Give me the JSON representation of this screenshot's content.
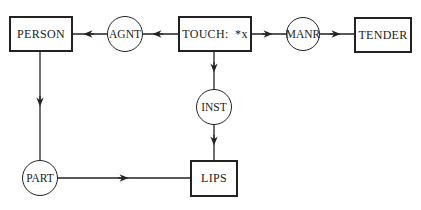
{
  "diagram": {
    "type": "conceptual-graph",
    "concepts": [
      {
        "id": "person",
        "label": "PERSON",
        "shape": "box"
      },
      {
        "id": "touch",
        "label": "TOUCH:  *x",
        "shape": "box"
      },
      {
        "id": "tender",
        "label": "TENDER",
        "shape": "box"
      },
      {
        "id": "lips",
        "label": "LIPS",
        "shape": "box"
      }
    ],
    "relations": [
      {
        "id": "agnt",
        "label": "AGNT",
        "shape": "circle"
      },
      {
        "id": "manr",
        "label": "MANR",
        "shape": "circle"
      },
      {
        "id": "inst",
        "label": "INST",
        "shape": "circle"
      },
      {
        "id": "part",
        "label": "PART",
        "shape": "circle"
      }
    ],
    "edges": [
      {
        "from": "touch",
        "to": "agnt"
      },
      {
        "from": "agnt",
        "to": "person"
      },
      {
        "from": "touch",
        "to": "manr"
      },
      {
        "from": "manr",
        "to": "tender"
      },
      {
        "from": "touch",
        "to": "inst"
      },
      {
        "from": "inst",
        "to": "lips"
      },
      {
        "from": "person",
        "to": "part"
      },
      {
        "from": "part",
        "to": "lips"
      }
    ],
    "colors": {
      "stroke": "#222222",
      "background": "#ffffff"
    }
  }
}
